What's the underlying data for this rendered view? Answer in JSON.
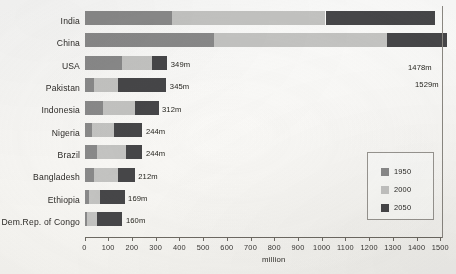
{
  "chart_data": {
    "type": "bar",
    "orientation": "horizontal",
    "stacked": true,
    "title": "",
    "xlabel": "million",
    "ylabel": "",
    "xlim": [
      0,
      1550
    ],
    "xticks": [
      0,
      100,
      200,
      300,
      400,
      500,
      600,
      700,
      800,
      900,
      1000,
      1100,
      1200,
      1300,
      1400,
      1500
    ],
    "grid": false,
    "legend_position": "bottom-right",
    "categories": [
      "India",
      "China",
      "USA",
      "Pakistan",
      "Indonesia",
      "Nigeria",
      "Brazil",
      "Bangladesh",
      "Ethiopia",
      "Dem.Rep. of Congo"
    ],
    "series": [
      {
        "name": "1950",
        "color": "#8b8b8b",
        "values": [
          369,
          544,
          158,
          40,
          80,
          33,
          54,
          42,
          18,
          12
        ]
      },
      {
        "name": "2000",
        "color": "#c6c6c4",
        "values": [
          647,
          731,
          127,
          103,
          132,
          92,
          120,
          99,
          46,
          39
        ]
      },
      {
        "name": "2050",
        "color": "#474749",
        "values": [
          462,
          254,
          64,
          202,
          100,
          119,
          70,
          71,
          105,
          109
        ]
      }
    ],
    "totals": [
      1478,
      1529,
      349,
      345,
      312,
      244,
      244,
      212,
      169,
      160
    ],
    "value_labels": [
      "1478m",
      "1529m",
      "349m",
      "345m",
      "312m",
      "244m",
      "244m",
      "212m",
      "169m",
      "160m"
    ]
  },
  "legend": {
    "entries": [
      {
        "label": "1950",
        "color": "#8b8b8b"
      },
      {
        "label": "2000",
        "color": "#c6c6c4"
      },
      {
        "label": "2050",
        "color": "#474749"
      }
    ]
  },
  "axis": {
    "title": "million",
    "tick_labels": [
      "0",
      "100",
      "200",
      "300",
      "400",
      "500",
      "600",
      "700",
      "800",
      "900",
      "1000",
      "1100",
      "1200",
      "1300",
      "1400",
      "1500"
    ]
  }
}
